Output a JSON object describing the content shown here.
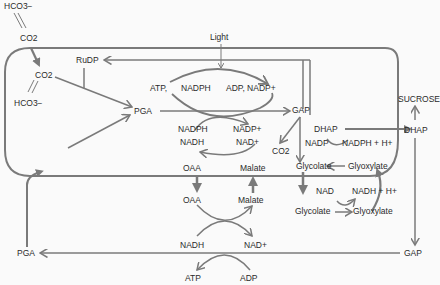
{
  "diagram": {
    "colors": {
      "line": "#7a7a7a",
      "text": "#2a2a2a",
      "background": "#fafafa"
    },
    "labels": {
      "hco3_outer": "HCO3−",
      "co2_outer": "CO2",
      "co2_inner": "CO2",
      "hco3_inner": "HCO3−",
      "rudp": "RuDP",
      "light": "Light",
      "atp_top": "ATP,",
      "nadph_top": "NADPH",
      "adp_nadp_top": "ADP, NADP+",
      "pga_inner": "PGA",
      "gap_inner": "GAP",
      "dhap_inner": "DHAP",
      "co2_gap": "CO2",
      "nadph_mid": "NADPH",
      "nadp_mid": "NADP+",
      "nadh_mid": "NADH",
      "nad_mid": "NAD+",
      "oaa_inner": "OAA",
      "malate_inner": "Malate",
      "nadp_glyc": "NADP",
      "nadph_h_glyc": "NADPH + H+",
      "glycolate_inner": "Glycolate",
      "glyoxylate_inner": "Glyoxylate",
      "sucrose": "SUCROSE",
      "dhap_outer": "DHAP",
      "oaa_outer": "OAA",
      "malate_outer": "Malate",
      "nad_out": "NAD",
      "nadh_h_out": "NADH + H+",
      "glycolate_outer": "Glycolate",
      "glyoxylate_outer": "Glyoxylate",
      "nadh_low": "NADH",
      "nad_low": "NAD+",
      "pga_outer": "PGA",
      "gap_outer": "GAP",
      "atp_bottom": "ATP",
      "adp_bottom": "ADP"
    }
  }
}
